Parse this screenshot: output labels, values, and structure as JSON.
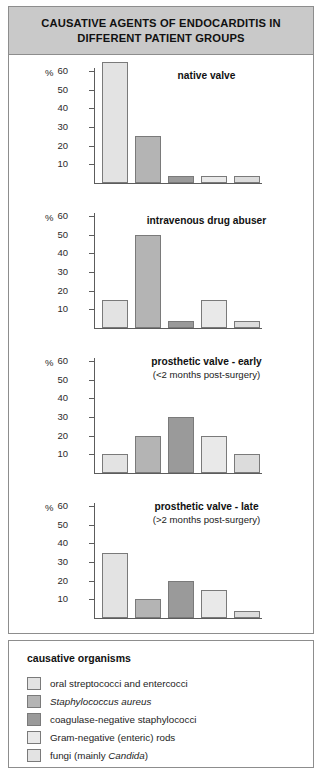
{
  "header": {
    "title_line1": "CAUSATIVE AGENTS OF ENDOCARDITIS IN",
    "title_line2": "DIFFERENT PATIENT GROUPS",
    "banner_color": "#c9c9c9"
  },
  "axis": {
    "unit_symbol": "%",
    "ticks": [
      "60",
      "50",
      "40",
      "30",
      "20",
      "10"
    ]
  },
  "legend": {
    "heading": "causative organisms",
    "items": [
      {
        "label": "oral streptococci and entercocci",
        "italic_part": "",
        "color": "#e3e3e3"
      },
      {
        "label": "Staphylococcus aureus",
        "italic_part": "Staphylococcus aureus",
        "color": "#b4b4b4"
      },
      {
        "label": "coagulase-negative staphylococci",
        "italic_part": "",
        "color": "#9a9a9a"
      },
      {
        "label": "Gram-negative (enteric) rods",
        "italic_part": "",
        "color": "#e9e9e9"
      },
      {
        "label": "fungi (mainly Candida)",
        "italic_part": "Candida",
        "color": "#e3e3e3"
      }
    ]
  },
  "chart_data": [
    {
      "type": "bar",
      "title": "native valve",
      "subtitle": "",
      "categories": [
        "oral streptococci and entercocci",
        "Staphylococcus aureus",
        "coagulase-negative staphylococci",
        "Gram-negative (enteric) rods",
        "fungi (mainly Candida)"
      ],
      "values": [
        65,
        25,
        4,
        4,
        4
      ],
      "colors": [
        "#e3e3e3",
        "#b4b4b4",
        "#9a9a9a",
        "#e9e9e9",
        "#dcdcdc"
      ],
      "xlabel": "",
      "ylabel": "%",
      "ylim": [
        0,
        65
      ],
      "grid": false,
      "legend_position": "bottom-panel"
    },
    {
      "type": "bar",
      "title": "intravenous drug abuser",
      "subtitle": "",
      "categories": [
        "oral streptococci and entercocci",
        "Staphylococcus aureus",
        "coagulase-negative staphylococci",
        "Gram-negative (enteric) rods",
        "fungi (mainly Candida)"
      ],
      "values": [
        15,
        50,
        4,
        15,
        4
      ],
      "colors": [
        "#e3e3e3",
        "#b4b4b4",
        "#9a9a9a",
        "#e9e9e9",
        "#dcdcdc"
      ],
      "xlabel": "",
      "ylabel": "%",
      "ylim": [
        0,
        65
      ],
      "grid": false,
      "legend_position": "bottom-panel"
    },
    {
      "type": "bar",
      "title": "prosthetic valve - early",
      "subtitle": "(<2 months post-surgery)",
      "categories": [
        "oral streptococci and entercocci",
        "Staphylococcus aureus",
        "coagulase-negative staphylococci",
        "Gram-negative (enteric) rods",
        "fungi (mainly Candida)"
      ],
      "values": [
        10,
        20,
        30,
        20,
        10
      ],
      "colors": [
        "#e3e3e3",
        "#b4b4b4",
        "#9a9a9a",
        "#e9e9e9",
        "#dcdcdc"
      ],
      "xlabel": "",
      "ylabel": "%",
      "ylim": [
        0,
        65
      ],
      "grid": false,
      "legend_position": "bottom-panel"
    },
    {
      "type": "bar",
      "title": "prosthetic valve - late",
      "subtitle": "(>2 months post-surgery)",
      "categories": [
        "oral streptococci and entercocci",
        "Staphylococcus aureus",
        "coagulase-negative staphylococci",
        "Gram-negative (enteric) rods",
        "fungi (mainly Candida)"
      ],
      "values": [
        35,
        10,
        20,
        15,
        4
      ],
      "colors": [
        "#e3e3e3",
        "#b4b4b4",
        "#9a9a9a",
        "#e9e9e9",
        "#dcdcdc"
      ],
      "xlabel": "",
      "ylabel": "%",
      "ylim": [
        0,
        65
      ],
      "grid": false,
      "legend_position": "bottom-panel"
    }
  ]
}
